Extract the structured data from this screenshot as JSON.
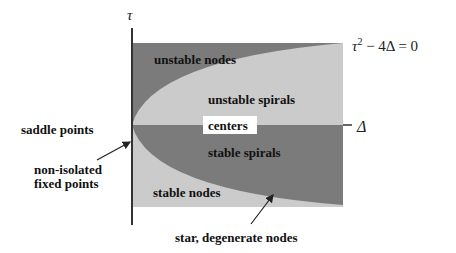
{
  "diagram": {
    "type": "trace-determinant plane classification",
    "colors": {
      "dark_region": "#7b7b7b",
      "light_region": "#cbcbcb",
      "axis": "#333333",
      "text": "#111111",
      "background": "#ffffff",
      "centers_box": "#ffffff"
    },
    "axes": {
      "vertical_label": "τ",
      "horizontal_label": "Δ"
    },
    "curve_label": {
      "tau": "τ",
      "superscript": "2",
      "rest": " − 4Δ = 0"
    },
    "regions": {
      "unstable_nodes": "unstable nodes",
      "unstable_spirals": "unstable spirals",
      "centers": "centers",
      "stable_spirals": "stable spirals",
      "stable_nodes": "stable nodes",
      "saddle_points": "saddle points"
    },
    "annotations": {
      "non_isolated_line1": "non-isolated",
      "non_isolated_line2": "fixed points",
      "star_degenerate": "star, degenerate nodes"
    }
  }
}
